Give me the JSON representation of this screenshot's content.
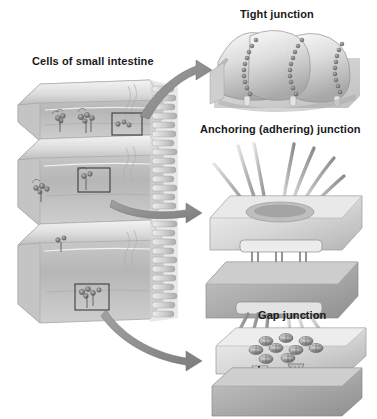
{
  "figure": {
    "title_overview_label": "Cells of small intestine",
    "background_color": "#ffffff",
    "text_color": "#1a1a1a",
    "palette": {
      "membrane_light": "#e8e8e8",
      "membrane_mid": "#c9c9c9",
      "membrane_dark": "#9a9a9a",
      "protein_dark": "#6d6d6d",
      "arrow_gray": "#8a8a8a",
      "box_outline": "#3c3c3c"
    }
  },
  "overview": {
    "label": "Cells of small intestine",
    "description": "Stack of three columnar epithelial cells with apical microvilli",
    "cell_count": 3,
    "callout_boxes": [
      {
        "name": "tight-junction-box",
        "x": 112,
        "y": 113,
        "w": 30,
        "h": 22
      },
      {
        "name": "anchoring-junction-box",
        "x": 78,
        "y": 168,
        "w": 32,
        "h": 24
      },
      {
        "name": "gap-junction-box",
        "x": 75,
        "y": 284,
        "w": 34,
        "h": 26
      }
    ],
    "arrows": [
      {
        "name": "arrow-to-tight-junction",
        "from": "tight-junction-box",
        "to": "tight-junction-panel"
      },
      {
        "name": "arrow-to-anchoring-junction",
        "from": "anchoring-junction-box",
        "to": "anchoring-junction-panel"
      },
      {
        "name": "arrow-to-gap-junction",
        "from": "gap-junction-box",
        "to": "gap-junction-panel"
      }
    ]
  },
  "panels": [
    {
      "id": "tight-junction",
      "label": "Tight junction",
      "features": [
        "undulating plasma membrane sheets",
        "beaded sealing strands",
        "fused membrane ridges"
      ],
      "strand_count": 3
    },
    {
      "id": "anchoring-junction",
      "label": "Anchoring (adhering) junction",
      "features": [
        "two parallel membrane sheets",
        "dense cytoplasmic plaques",
        "transmembrane linker proteins",
        "radiating intermediate filaments"
      ],
      "linker_count": 4
    },
    {
      "id": "gap-junction",
      "label": "Gap junction",
      "features": [
        "connexon ring clusters",
        "hourglass channel pair bridging the intercellular gap"
      ],
      "connexon_count": 9,
      "channel_count": 2
    }
  ]
}
